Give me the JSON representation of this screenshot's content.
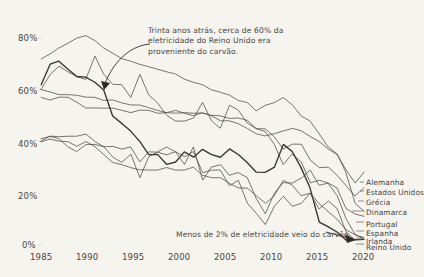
{
  "chart_data": {
    "type": "line",
    "title": "",
    "xlabel": "",
    "ylabel": "",
    "xlim": [
      1985,
      2021
    ],
    "ylim": [
      0,
      90
    ],
    "grid": false,
    "legend_position": "right-inside",
    "x_ticks": [
      "1985",
      "1990",
      "1995",
      "2000",
      "2005",
      "2010",
      "2015",
      "2020"
    ],
    "x_tick_values": [
      1985,
      1990,
      1995,
      2000,
      2005,
      2010,
      2015,
      2020
    ],
    "y_ticks": [
      "0%",
      "20%",
      "40%",
      "60%",
      "80%"
    ],
    "y_tick_values": [
      0,
      20,
      40,
      60,
      80
    ],
    "x": [
      1985,
      1986,
      1987,
      1988,
      1989,
      1990,
      1991,
      1992,
      1993,
      1994,
      1995,
      1996,
      1997,
      1998,
      1999,
      2000,
      2001,
      2002,
      2003,
      2004,
      2005,
      2006,
      2007,
      2008,
      2009,
      2010,
      2011,
      2012,
      2013,
      2014,
      2015,
      2016,
      2017,
      2018,
      2019,
      2020,
      2021
    ],
    "series": [
      {
        "name": "Grécia",
        "values": [
          72,
          74,
          76,
          78,
          80,
          81,
          79,
          76,
          74,
          72,
          71,
          70,
          69,
          68,
          67,
          66,
          64,
          63,
          62,
          60,
          59,
          58,
          56,
          55,
          52,
          54,
          55,
          57,
          54,
          50,
          48,
          43,
          38,
          35,
          28,
          16,
          13
        ]
      },
      {
        "name": "Dinamarca",
        "values": [
          60,
          66,
          69,
          67,
          65,
          64,
          73,
          66,
          62,
          62,
          57,
          66,
          58,
          55,
          50,
          48,
          48,
          49,
          55,
          48,
          45,
          54,
          52,
          47,
          45,
          44,
          39,
          31,
          35,
          32,
          24,
          25,
          24,
          22,
          14,
          12,
          11
        ]
      },
      {
        "name": "Alemanha",
        "values": [
          60,
          59,
          58,
          58,
          58,
          57,
          57,
          56,
          56,
          55,
          54,
          54,
          53,
          52,
          51,
          51,
          51,
          51,
          51,
          50,
          48,
          48,
          47,
          45,
          43,
          42,
          43,
          44,
          45,
          44,
          42,
          40,
          37,
          35,
          29,
          24,
          28
        ]
      },
      {
        "name": "Estados Unidos",
        "values": [
          57,
          56,
          57,
          57,
          55,
          53,
          53,
          53,
          53,
          52,
          51,
          52,
          52,
          51,
          51,
          52,
          51,
          50,
          51,
          50,
          50,
          49,
          49,
          48,
          45,
          45,
          42,
          37,
          39,
          39,
          33,
          30,
          30,
          27,
          23,
          19,
          22
        ]
      },
      {
        "name": "Reino Unido",
        "values": [
          62,
          70,
          71,
          68,
          65,
          65,
          63,
          60,
          50,
          47,
          44,
          40,
          35,
          35,
          31,
          32,
          36,
          34,
          37,
          35,
          34,
          37,
          35,
          32,
          28,
          28,
          30,
          39,
          36,
          30,
          22,
          9,
          7,
          5,
          2,
          2,
          2
        ]
      },
      {
        "name": "Portugal",
        "values": [
          40,
          42,
          42,
          42,
          42,
          43,
          40,
          38,
          34,
          32,
          35,
          26,
          34,
          36,
          38,
          36,
          31,
          38,
          25,
          30,
          31,
          27,
          28,
          26,
          18,
          12,
          20,
          24,
          24,
          26,
          29,
          23,
          24,
          19,
          10,
          4,
          2
        ]
      },
      {
        "name": "Espanha",
        "values": [
          41,
          42,
          41,
          38,
          36,
          39,
          39,
          38,
          38,
          37,
          38,
          32,
          36,
          36,
          35,
          36,
          34,
          36,
          28,
          29,
          29,
          23,
          25,
          16,
          12,
          8,
          15,
          19,
          15,
          16,
          20,
          14,
          17,
          14,
          5,
          2,
          2
        ]
      },
      {
        "name": "Irlanda",
        "values": [
          40,
          41,
          40,
          40,
          38,
          40,
          38,
          35,
          32,
          31,
          30,
          29,
          29,
          29,
          30,
          29,
          29,
          30,
          27,
          26,
          26,
          24,
          22,
          22,
          19,
          16,
          19,
          25,
          23,
          19,
          20,
          16,
          13,
          10,
          6,
          4,
          3
        ]
      }
    ],
    "annotations": [
      {
        "id": "uk-1990-annotation",
        "text": "Trinta anos atrás, cerca de 60% da\neletricidade do Reino Unido era\nproveniente do carvão."
      },
      {
        "id": "uk-2020-annotation",
        "text": "Menos de 2% de eletricidade veio do carvão"
      }
    ],
    "legend_entries": [
      "Alemanha",
      "Estados Unidos",
      "Grécia",
      "Dinamarca",
      "Portugal",
      "Espanha",
      "Irlanda",
      "Reino Unido"
    ],
    "colors": {
      "background": "#f6f4ee",
      "line": "#4f4b45",
      "line_emphasis": "#2e2b27",
      "text": "#4a4641"
    }
  }
}
